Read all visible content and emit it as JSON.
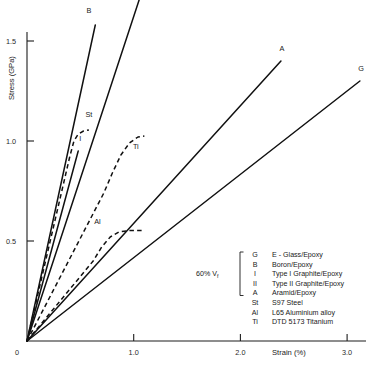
{
  "chart_data": {
    "type": "line",
    "title": "",
    "xlabel": "Strain (%)",
    "ylabel": "Stress (GPa)",
    "xlim": [
      0,
      3.22
    ],
    "ylim": [
      0,
      1.75
    ],
    "xticks": [
      "0",
      "1.0",
      "2.0",
      "3.0"
    ],
    "xtick_values": [
      0,
      1.0,
      2.0,
      3.0
    ],
    "yticks": [
      "0.5",
      "1.0",
      "1.5"
    ],
    "ytick_values": [
      0.5,
      1.0,
      1.5
    ],
    "grid": false,
    "legend_position": "inside-lower-right",
    "annotation": "60% Vf",
    "series": [
      {
        "name": "B",
        "label": "B",
        "description": "Boron/Epoxy",
        "style": "solid",
        "modulus_gpa_per_pct": 2.47,
        "points": [
          [
            0,
            0
          ],
          [
            0.64,
            1.58
          ]
        ],
        "label_xy": [
          0.58,
          1.64
        ]
      },
      {
        "name": "II",
        "label": "II",
        "description": "Type II Graphite/Epoxy",
        "style": "solid",
        "modulus_gpa_per_pct": 1.62,
        "points": [
          [
            0,
            0
          ],
          [
            1.06,
            1.72
          ]
        ],
        "label_xy": [
          1.02,
          1.79
        ]
      },
      {
        "name": "I",
        "label": "I",
        "description": "Type I Graphite/Epoxy",
        "style": "solid",
        "modulus_gpa_per_pct": 1.98,
        "points": [
          [
            0,
            0
          ],
          [
            0.48,
            0.95
          ]
        ],
        "label_xy": [
          0.5,
          1.0
        ]
      },
      {
        "name": "A",
        "label": "A",
        "description": "Aramid/Epoxy",
        "style": "solid",
        "modulus_gpa_per_pct": 0.59,
        "points": [
          [
            0,
            0
          ],
          [
            2.38,
            1.4
          ]
        ],
        "label_xy": [
          2.39,
          1.45
        ]
      },
      {
        "name": "G",
        "label": "G",
        "description": "E - Glass/Epoxy",
        "style": "solid",
        "modulus_gpa_per_pct": 0.42,
        "points": [
          [
            0,
            0
          ],
          [
            3.12,
            1.3
          ]
        ],
        "label_xy": [
          3.13,
          1.35
        ]
      },
      {
        "name": "St",
        "label": "St",
        "description": "S97 Steel",
        "style": "dashed",
        "yield_stress": 0.95,
        "plateau_stress": 1.05,
        "points": [
          [
            0,
            0
          ],
          [
            0.4,
            0.92
          ],
          [
            0.44,
            1.0
          ],
          [
            0.48,
            1.035
          ],
          [
            0.53,
            1.05
          ],
          [
            0.58,
            1.055
          ]
        ],
        "label_xy": [
          0.58,
          1.12
        ]
      },
      {
        "name": "Ti",
        "label": "Ti",
        "description": "DTD 5173 Titanium",
        "style": "dashed",
        "yield_stress": 0.8,
        "plateau_stress": 1.02,
        "points": [
          [
            0,
            0
          ],
          [
            0.72,
            0.74
          ],
          [
            0.8,
            0.84
          ],
          [
            0.88,
            0.93
          ],
          [
            0.96,
            0.99
          ],
          [
            1.04,
            1.02
          ],
          [
            1.1,
            1.025
          ]
        ],
        "label_xy": [
          1.02,
          0.96
        ]
      },
      {
        "name": "Al",
        "label": "Al",
        "description": "L65 Aluminium alloy",
        "style": "dashed",
        "yield_stress": 0.42,
        "plateau_stress": 0.55,
        "points": [
          [
            0,
            0
          ],
          [
            0.62,
            0.4
          ],
          [
            0.7,
            0.47
          ],
          [
            0.78,
            0.52
          ],
          [
            0.86,
            0.545
          ],
          [
            0.96,
            0.552
          ],
          [
            1.1,
            0.553
          ]
        ],
        "label_xy": [
          0.66,
          0.585
        ]
      }
    ]
  },
  "legend": {
    "group_label": "60% V",
    "group_label_sub": "f",
    "bracketed": [
      "G",
      "B",
      "I",
      "II",
      "A"
    ],
    "rows": [
      {
        "key": "G",
        "text": "E - Glass/Epoxy"
      },
      {
        "key": "B",
        "text": "Boron/Epoxy"
      },
      {
        "key": "I",
        "text": "Type I Graphite/Epoxy"
      },
      {
        "key": "II",
        "text": "Type II Graphite/Epoxy"
      },
      {
        "key": "A",
        "text": "Aramid/Epoxy"
      },
      {
        "key": "St",
        "text": "S97 Steel"
      },
      {
        "key": "Al",
        "text": "L65 Aluminium alloy"
      },
      {
        "key": "Ti",
        "text": "DTD 5173 Titanium"
      }
    ]
  },
  "colors": {
    "background": "#ffffff",
    "ink": "#111111",
    "axis": "#1d1d1d"
  }
}
